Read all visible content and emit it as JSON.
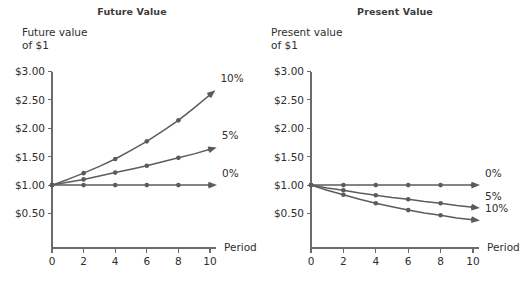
{
  "figure": {
    "panels": [
      {
        "id": "fv",
        "title": "Future Value",
        "caption": "Future value\nof $1",
        "xlabel": "Period",
        "ylabel": "Future value of $1",
        "yticks": [
          "$0.50",
          "$1.00",
          "$1.50",
          "$2.00",
          "$2.50",
          "$3.00"
        ],
        "ytick_values": [
          0.5,
          1.0,
          1.5,
          2.0,
          2.5,
          3.0
        ],
        "xticks": [
          "0",
          "2",
          "4",
          "6",
          "8",
          "10"
        ],
        "xtick_values": [
          0,
          2,
          4,
          6,
          8,
          10
        ],
        "series_labels": [
          "10%",
          "5%",
          "0%"
        ]
      },
      {
        "id": "pv",
        "title": "Present Value",
        "caption": "Present value\nof $1",
        "xlabel": "Period",
        "ylabel": "Present value of $1",
        "yticks": [
          "$0.50",
          "$1.00",
          "$1.50",
          "$2.00",
          "$2.50",
          "$3.00"
        ],
        "ytick_values": [
          0.5,
          1.0,
          1.5,
          2.0,
          2.5,
          3.0
        ],
        "xticks": [
          "0",
          "2",
          "4",
          "6",
          "8",
          "10"
        ],
        "xtick_values": [
          0,
          2,
          4,
          6,
          8,
          10
        ],
        "series_labels": [
          "0%",
          "5%",
          "10%"
        ]
      }
    ],
    "colors": {
      "line": "#5c5c5c",
      "axis": "#6b6b6b",
      "text": "#2e2e2e",
      "title": "#3a3a3a",
      "background": "#ffffff"
    }
  },
  "chart_data": [
    {
      "type": "line",
      "title": "Future Value",
      "xlabel": "Period",
      "ylabel": "Future value of $1",
      "xlim": [
        0,
        10
      ],
      "ylim": [
        0.25,
        3.0
      ],
      "grid": false,
      "legend": "inline-right",
      "x": [
        0,
        1,
        2,
        3,
        4,
        5,
        6,
        7,
        8,
        9,
        10
      ],
      "series": [
        {
          "name": "10%",
          "values": [
            1.0,
            1.1,
            1.21,
            1.33,
            1.46,
            1.61,
            1.77,
            1.95,
            2.14,
            2.36,
            2.59
          ],
          "marker_x": [
            0,
            2,
            4,
            6,
            8,
            10
          ],
          "marker_values": [
            1.0,
            1.21,
            1.46,
            1.77,
            2.14,
            2.59
          ]
        },
        {
          "name": "5%",
          "values": [
            1.0,
            1.05,
            1.1,
            1.16,
            1.22,
            1.28,
            1.34,
            1.41,
            1.48,
            1.55,
            1.63
          ],
          "marker_x": [
            0,
            2,
            4,
            6,
            8,
            10
          ],
          "marker_values": [
            1.0,
            1.1,
            1.22,
            1.34,
            1.48,
            1.63
          ]
        },
        {
          "name": "0%",
          "values": [
            1.0,
            1.0,
            1.0,
            1.0,
            1.0,
            1.0,
            1.0,
            1.0,
            1.0,
            1.0,
            1.0
          ],
          "marker_x": [
            0,
            2,
            4,
            6,
            8,
            10
          ],
          "marker_values": [
            1.0,
            1.0,
            1.0,
            1.0,
            1.0,
            1.0
          ]
        }
      ]
    },
    {
      "type": "line",
      "title": "Present Value",
      "xlabel": "Period",
      "ylabel": "Present value of $1",
      "xlim": [
        0,
        10
      ],
      "ylim": [
        0.25,
        3.0
      ],
      "grid": false,
      "legend": "inline-right",
      "x": [
        0,
        1,
        2,
        3,
        4,
        5,
        6,
        7,
        8,
        9,
        10
      ],
      "series": [
        {
          "name": "0%",
          "values": [
            1.0,
            1.0,
            1.0,
            1.0,
            1.0,
            1.0,
            1.0,
            1.0,
            1.0,
            1.0,
            1.0
          ],
          "marker_x": [
            0,
            2,
            4,
            6,
            8,
            10
          ],
          "marker_values": [
            1.0,
            1.0,
            1.0,
            1.0,
            1.0,
            1.0
          ]
        },
        {
          "name": "5%",
          "values": [
            1.0,
            0.95,
            0.91,
            0.86,
            0.82,
            0.78,
            0.75,
            0.71,
            0.68,
            0.64,
            0.61
          ],
          "marker_x": [
            0,
            2,
            4,
            6,
            8,
            10
          ],
          "marker_values": [
            1.0,
            0.91,
            0.82,
            0.75,
            0.68,
            0.61
          ]
        },
        {
          "name": "10%",
          "values": [
            1.0,
            0.91,
            0.83,
            0.75,
            0.68,
            0.62,
            0.56,
            0.51,
            0.47,
            0.42,
            0.39
          ],
          "marker_x": [
            0,
            2,
            4,
            6,
            8,
            10
          ],
          "marker_values": [
            1.0,
            0.83,
            0.68,
            0.56,
            0.47,
            0.39
          ]
        }
      ]
    }
  ]
}
